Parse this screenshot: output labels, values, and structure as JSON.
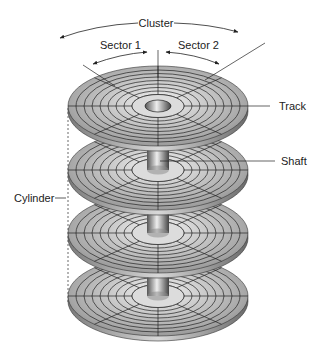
{
  "diagram": {
    "labels": {
      "cluster": "Cluster",
      "sector1": "Sector 1",
      "sector2": "Sector 2",
      "track": "Track",
      "shaft": "Shaft",
      "cylinder": "Cylinder"
    },
    "platter_count": 4,
    "track_rings_per_platter": 8,
    "colors": {
      "platter_light": "#e6e6e6",
      "platter_dark": "#8a8a8a",
      "line": "#222222",
      "background": "#ffffff"
    }
  }
}
